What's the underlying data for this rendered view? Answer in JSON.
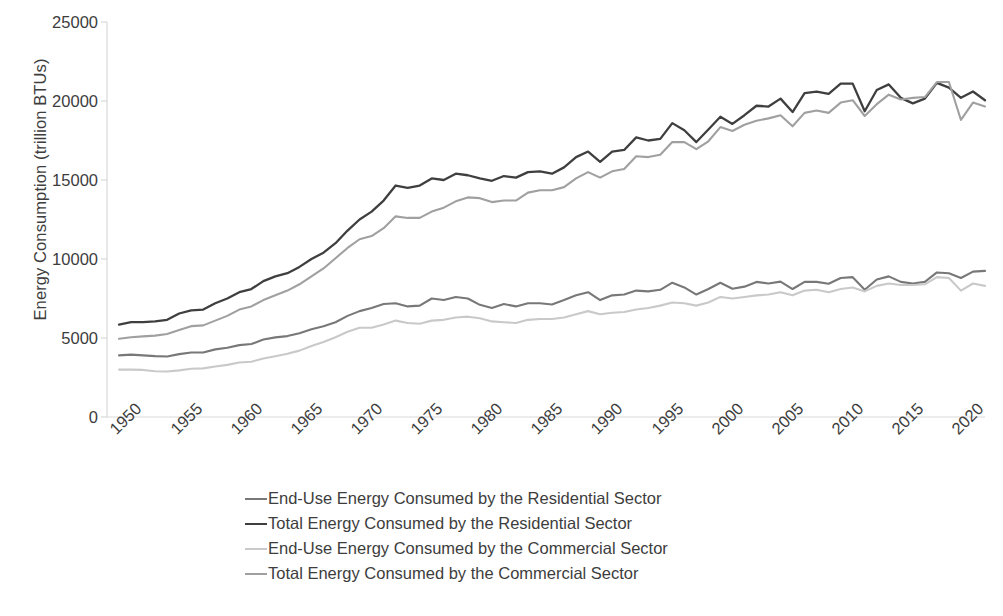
{
  "chart_data": {
    "type": "line",
    "title": "",
    "xlabel": "",
    "ylabel": "Energy Consumption (trillion BTUs)",
    "xlim": [
      1949,
      2022
    ],
    "ylim": [
      0,
      25000
    ],
    "y_ticks": [
      0,
      5000,
      10000,
      15000,
      20000,
      25000
    ],
    "y_tick_labels": [
      "0",
      "5000",
      "10000",
      "15000",
      "20000",
      "25000"
    ],
    "x_ticks": [
      1950,
      1955,
      1960,
      1965,
      1970,
      1975,
      1980,
      1985,
      1990,
      1995,
      2000,
      2005,
      2010,
      2015,
      2020
    ],
    "x_tick_labels": [
      "1950",
      "1955",
      "1960",
      "1965",
      "1970",
      "1975",
      "1980",
      "1985",
      "1990",
      "1995",
      "2000",
      "2005",
      "2010",
      "2015",
      "2020"
    ],
    "grid": false,
    "legend_position": "bottom",
    "x": [
      1950,
      1951,
      1952,
      1953,
      1954,
      1955,
      1956,
      1957,
      1958,
      1959,
      1960,
      1961,
      1962,
      1963,
      1964,
      1965,
      1966,
      1967,
      1968,
      1969,
      1970,
      1971,
      1972,
      1973,
      1974,
      1975,
      1976,
      1977,
      1978,
      1979,
      1980,
      1981,
      1982,
      1983,
      1984,
      1985,
      1986,
      1987,
      1988,
      1989,
      1990,
      1991,
      1992,
      1993,
      1994,
      1995,
      1996,
      1997,
      1998,
      1999,
      2000,
      2001,
      2002,
      2003,
      2004,
      2005,
      2006,
      2007,
      2008,
      2009,
      2010,
      2011,
      2012,
      2013,
      2014,
      2015,
      2016,
      2017,
      2018,
      2019,
      2020,
      2021,
      2022
    ],
    "series": [
      {
        "name": "End-Use Energy Consumed by the Residential Sector",
        "color": "#787878",
        "width": 2.1,
        "values": [
          3900,
          3950,
          3900,
          3850,
          3830,
          3980,
          4080,
          4080,
          4280,
          4380,
          4550,
          4620,
          4900,
          5040,
          5120,
          5300,
          5550,
          5750,
          6000,
          6400,
          6700,
          6900,
          7150,
          7200,
          7000,
          7050,
          7500,
          7400,
          7600,
          7500,
          7100,
          6900,
          7150,
          7000,
          7200,
          7200,
          7120,
          7400,
          7700,
          7900,
          7400,
          7700,
          7750,
          8000,
          7950,
          8050,
          8500,
          8200,
          7750,
          8100,
          8500,
          8120,
          8250,
          8550,
          8450,
          8570,
          8100,
          8550,
          8550,
          8430,
          8800,
          8850,
          8050,
          8700,
          8900,
          8550,
          8450,
          8550,
          9150,
          9100,
          8800,
          9200,
          9250
        ]
      },
      {
        "name": "Total Energy Consumed by the Residential Sector",
        "color": "#3f3f3f",
        "width": 2.3,
        "values": [
          5850,
          6000,
          6000,
          6050,
          6150,
          6550,
          6750,
          6800,
          7200,
          7500,
          7900,
          8100,
          8600,
          8900,
          9100,
          9500,
          10000,
          10400,
          11000,
          11800,
          12500,
          13000,
          13700,
          14650,
          14500,
          14650,
          15100,
          15000,
          15400,
          15300,
          15100,
          14950,
          15250,
          15150,
          15500,
          15550,
          15400,
          15800,
          16450,
          16800,
          16150,
          16800,
          16900,
          17700,
          17500,
          17600,
          18600,
          18150,
          17400,
          18200,
          19000,
          18550,
          19100,
          19700,
          19650,
          20150,
          19300,
          20500,
          20600,
          20450,
          21100,
          21100,
          19350,
          20700,
          21050,
          20200,
          19850,
          20150,
          21150,
          20850,
          20200,
          20600,
          20050
        ]
      },
      {
        "name": "End-Use Energy Consumed by the Commercial Sector",
        "color": "#c9c9c9",
        "width": 2.1,
        "values": [
          3000,
          3000,
          2980,
          2900,
          2880,
          2950,
          3050,
          3080,
          3200,
          3300,
          3450,
          3500,
          3700,
          3850,
          4000,
          4200,
          4500,
          4750,
          5050,
          5400,
          5650,
          5650,
          5850,
          6100,
          5950,
          5900,
          6100,
          6150,
          6300,
          6350,
          6250,
          6050,
          6000,
          5950,
          6150,
          6200,
          6200,
          6300,
          6500,
          6700,
          6500,
          6600,
          6650,
          6800,
          6900,
          7050,
          7250,
          7200,
          7050,
          7250,
          7600,
          7500,
          7600,
          7700,
          7750,
          7900,
          7700,
          8000,
          8050,
          7900,
          8100,
          8200,
          7950,
          8300,
          8450,
          8350,
          8350,
          8400,
          8850,
          8800,
          8000,
          8450,
          8300
        ]
      },
      {
        "name": "Total Energy Consumed by the Commercial Sector",
        "color": "#a0a0a0",
        "width": 2.1,
        "values": [
          4950,
          5050,
          5100,
          5150,
          5250,
          5500,
          5750,
          5800,
          6100,
          6400,
          6800,
          7000,
          7400,
          7700,
          8000,
          8400,
          8900,
          9400,
          10050,
          10700,
          11250,
          11450,
          11950,
          12700,
          12600,
          12600,
          13000,
          13250,
          13650,
          13900,
          13850,
          13600,
          13700,
          13700,
          14200,
          14350,
          14350,
          14550,
          15100,
          15500,
          15150,
          15550,
          15700,
          16500,
          16450,
          16600,
          17400,
          17400,
          16950,
          17450,
          18350,
          18100,
          18500,
          18750,
          18900,
          19100,
          18400,
          19250,
          19400,
          19250,
          19900,
          20050,
          19050,
          19800,
          20400,
          20100,
          20200,
          20250,
          21200,
          21200,
          18800,
          19900,
          19650
        ]
      }
    ]
  },
  "legend": {
    "items": [
      {
        "label": "End-Use Energy Consumed by the Residential Sector",
        "color": "#787878",
        "width": 2.1
      },
      {
        "label": "Total Energy Consumed by the Residential Sector",
        "color": "#3f3f3f",
        "width": 2.8
      },
      {
        "label": "End-Use Energy Consumed by the Commercial Sector",
        "color": "#c9c9c9",
        "width": 2.1
      },
      {
        "label": "Total Energy Consumed by the Commercial Sector",
        "color": "#a0a0a0",
        "width": 2.1
      }
    ]
  },
  "axes": {
    "axis_line_color": "#d9d9d9",
    "tick_color": "#d9d9d9",
    "text_color": "#3d3d3d"
  }
}
